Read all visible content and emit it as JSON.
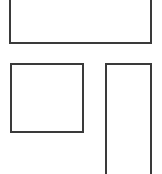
{
  "canvas": {
    "width": 162,
    "height": 174,
    "background": "#ffffff"
  },
  "shapes": [
    {
      "id": "top-rect",
      "type": "rectangle",
      "label": "",
      "stroke": "#3a3a3a",
      "fill": "#ffffff"
    },
    {
      "id": "square-rect",
      "type": "rectangle",
      "label": "",
      "stroke": "#3a3a3a",
      "fill": "#ffffff"
    },
    {
      "id": "tall-rect",
      "type": "rectangle",
      "label": "",
      "stroke": "#3a3a3a",
      "fill": "#ffffff"
    }
  ]
}
